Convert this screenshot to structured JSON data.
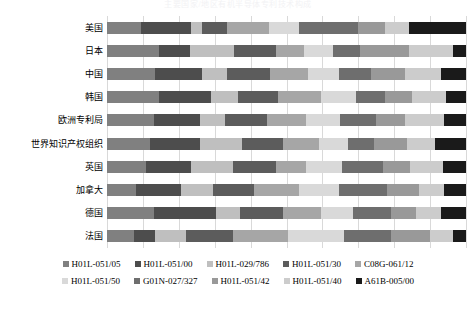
{
  "chart_data": {
    "type": "bar",
    "title": "主要国家/地区有机半导体专利技术构成",
    "orientation": "horizontal",
    "stacked": true,
    "normalized": true,
    "xlabel": "",
    "ylabel": "",
    "xlim": [
      0,
      100
    ],
    "gridlines": [
      0,
      10,
      20,
      30,
      40,
      50,
      60,
      70,
      80,
      90,
      100
    ],
    "grid": true,
    "legend_position": "bottom",
    "categories": [
      "美国",
      "日本",
      "中国",
      "韩国",
      "欧洲专利局",
      "世界知识产权组织",
      "英国",
      "加拿大",
      "德国",
      "法国"
    ],
    "series": [
      {
        "name": "H01L-051/05",
        "color": "#808080",
        "values": [
          9.5,
          14.5,
          13.5,
          14.5,
          13.0,
          12.0,
          11.0,
          8.0,
          13.0,
          7.5
        ]
      },
      {
        "name": "H01L-051/00",
        "color": "#4d4d4d",
        "values": [
          14.0,
          8.5,
          13.0,
          14.5,
          13.0,
          14.0,
          12.5,
          12.5,
          17.5,
          6.0
        ]
      },
      {
        "name": "H01L-029/786",
        "color": "#bfbfbf",
        "values": [
          3.0,
          12.5,
          7.0,
          7.5,
          7.0,
          11.5,
          11.5,
          9.0,
          6.5,
          8.5
        ]
      },
      {
        "name": "H01L-051/30",
        "color": "#5c5c5c",
        "values": [
          7.0,
          11.5,
          12.0,
          11.0,
          11.5,
          11.5,
          12.0,
          11.5,
          12.0,
          13.0
        ]
      },
      {
        "name": "C08G-061/12",
        "color": "#a6a6a6",
        "values": [
          11.5,
          8.0,
          10.5,
          12.0,
          11.0,
          10.0,
          8.5,
          12.5,
          10.5,
          15.5
        ]
      },
      {
        "name": "H01L-051/50",
        "color": "#d9d9d9",
        "values": [
          8.5,
          8.0,
          8.5,
          10.0,
          9.5,
          8.0,
          10.0,
          11.0,
          9.0,
          15.5
        ]
      },
      {
        "name": "G01N-027/327",
        "color": "#6e6e6e",
        "values": [
          16.5,
          7.5,
          9.0,
          8.0,
          10.0,
          7.5,
          11.5,
          13.5,
          10.5,
          13.0
        ]
      },
      {
        "name": "H01L-051/42",
        "color": "#999999",
        "values": [
          7.5,
          13.5,
          9.5,
          7.5,
          8.0,
          9.0,
          7.5,
          9.0,
          7.0,
          11.0
        ]
      },
      {
        "name": "H01L-051/40",
        "color": "#cccccc",
        "values": [
          6.5,
          12.5,
          10.0,
          9.5,
          11.0,
          8.0,
          9.0,
          7.0,
          7.0,
          6.5
        ]
      },
      {
        "name": "A61B-005/00",
        "color": "#1a1a1a",
        "values": [
          16.0,
          3.5,
          7.0,
          5.5,
          6.0,
          8.5,
          6.5,
          6.0,
          7.0,
          3.5
        ]
      }
    ]
  },
  "legend": {
    "rows": [
      [
        "H01L-051/05",
        "H01L-051/00",
        "H01L-029/786",
        "H01L-051/30",
        "C08G-061/12"
      ],
      [
        "H01L-051/50",
        "G01N-027/327",
        "H01L-051/42",
        "H01L-051/40",
        "A61B-005/00"
      ]
    ]
  }
}
